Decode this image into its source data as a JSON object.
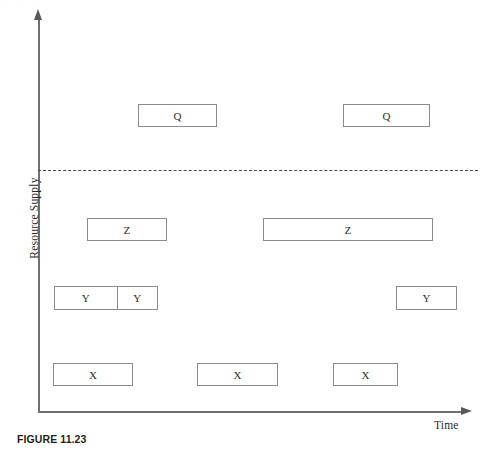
{
  "figure": {
    "caption": "FIGURE 11.23",
    "artifact_text": "·          ·          ·"
  },
  "axes": {
    "y_label": "Resource Supply",
    "x_label": "Time",
    "y_arrow_icon": "arrow-up-icon",
    "x_arrow_icon": "arrow-right-icon"
  },
  "threshold": {
    "name": "capacity-threshold",
    "style": "dashed"
  },
  "chart_data": {
    "type": "bar",
    "title": "FIGURE 11.23",
    "xlabel": "Time",
    "ylabel": "Resource Supply",
    "grid": false,
    "legend": null,
    "note": "Gantt-style resource-loading diagram: labelled task blocks positioned by start time (x) and resource level (y). A dashed horizontal line marks the resource supply limit; Q blocks sit above it.",
    "rows": [
      {
        "level": "Q",
        "y_top": 104,
        "y_bottom": 127,
        "above_threshold": true,
        "blocks": [
          {
            "label": "Q",
            "x_start": 138,
            "x_end": 217,
            "width": 79
          },
          {
            "label": "Q",
            "x_start": 343,
            "x_end": 430,
            "width": 87
          }
        ]
      },
      {
        "level": "Z",
        "y_top": 218,
        "y_bottom": 241,
        "above_threshold": false,
        "blocks": [
          {
            "label": "Z",
            "x_start": 87,
            "x_end": 167,
            "width": 80
          },
          {
            "label": "Z",
            "x_start": 263,
            "x_end": 433,
            "width": 170
          }
        ]
      },
      {
        "level": "Y",
        "y_top": 286,
        "y_bottom": 310,
        "above_threshold": false,
        "blocks": [
          {
            "label": "Y",
            "x_start": 54,
            "x_end": 117,
            "width": 63
          },
          {
            "label": "Y",
            "x_start": 117,
            "x_end": 158,
            "width": 41
          },
          {
            "label": "Y",
            "x_start": 396,
            "x_end": 457,
            "width": 61
          }
        ]
      },
      {
        "level": "X",
        "y_top": 363,
        "y_bottom": 386,
        "above_threshold": false,
        "blocks": [
          {
            "label": "X",
            "x_start": 53,
            "x_end": 133,
            "width": 80
          },
          {
            "label": "X",
            "x_start": 197,
            "x_end": 278,
            "width": 81
          },
          {
            "label": "X",
            "x_start": 333,
            "x_end": 398,
            "width": 65
          }
        ]
      }
    ],
    "threshold_line": {
      "y": 170,
      "x_start": 38,
      "x_end": 478
    },
    "axis_ranges": {
      "x": [
        38,
        467
      ],
      "y": [
        18,
        412
      ]
    }
  },
  "colors": {
    "block_border": "#8b8c8e",
    "axis": "#6f7072",
    "text": "#2b2b2d",
    "caption": "#231f20",
    "background": "#ffffff"
  }
}
